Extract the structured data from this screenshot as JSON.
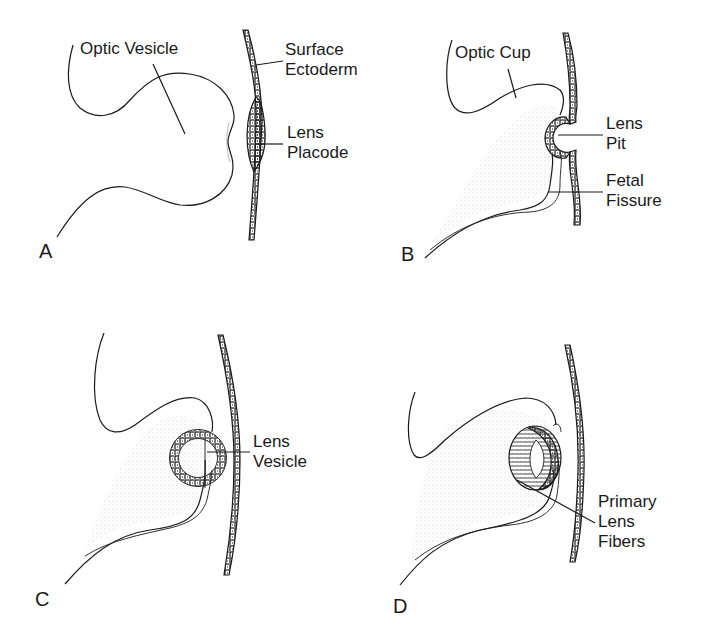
{
  "figure": {
    "panels": [
      {
        "id": "A",
        "letter": "A",
        "labels": [
          {
            "line1": "Optic Vesicle",
            "line2": ""
          },
          {
            "line1": "Surface",
            "line2": "Ectoderm"
          },
          {
            "line1": "Lens",
            "line2": "Placode"
          }
        ]
      },
      {
        "id": "B",
        "letter": "B",
        "labels": [
          {
            "line1": "Optic Cup",
            "line2": ""
          },
          {
            "line1": "Lens",
            "line2": "Pit"
          },
          {
            "line1": "Fetal",
            "line2": "Fissure"
          }
        ]
      },
      {
        "id": "C",
        "letter": "C",
        "labels": [
          {
            "line1": "Lens",
            "line2": "Vesicle"
          }
        ]
      },
      {
        "id": "D",
        "letter": "D",
        "labels": [
          {
            "line1": "Primary",
            "line2": "Lens",
            "line3": "Fibers"
          }
        ]
      }
    ]
  },
  "colors": {
    "stroke": "#1a1a1a",
    "stipple": "#9a9a9a",
    "background": "#ffffff"
  }
}
